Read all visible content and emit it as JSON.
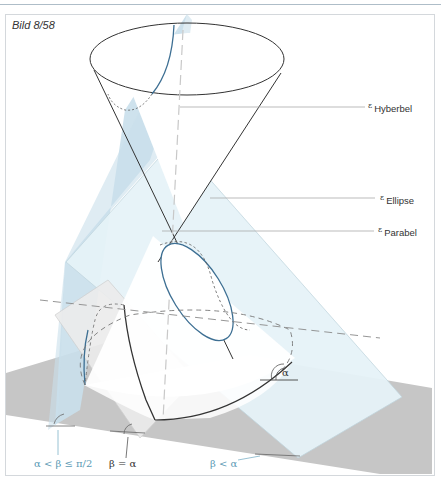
{
  "figure": {
    "title": "Bild 8/58"
  },
  "labels": {
    "hyperbel": {
      "symbol": "ε",
      "text": "Hyberbel"
    },
    "ellipse": {
      "symbol": "ε",
      "text": "Ellipse"
    },
    "parabel": {
      "symbol": "ε",
      "text": "Parabel"
    }
  },
  "angles": {
    "alpha_mark": "α",
    "hyperbel_condition": "α < β ≤ π/2",
    "parabel_condition": "β = α",
    "ellipse_condition": "β < α"
  },
  "colors": {
    "hyperbel_plane": "#c9dfeb",
    "ellipse_plane": "#e6f3f8",
    "parabel_plane": "#ececec",
    "ground_plane": "#c6c6c6",
    "curve_blue": "#3d6f93",
    "label_blue": "#5b9bb5",
    "line_dark": "#333333"
  }
}
